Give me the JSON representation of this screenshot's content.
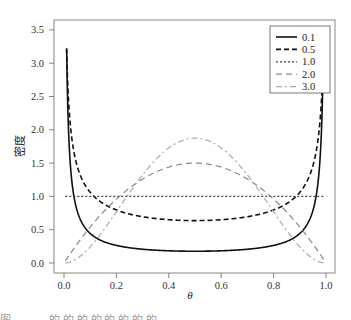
{
  "chart_data": {
    "type": "line",
    "title": "",
    "xlabel": "θ",
    "ylabel": "密度",
    "xlim": [
      0.0,
      1.0
    ],
    "ylim": [
      0.0,
      3.5
    ],
    "x_ticks": [
      "0.0",
      "0.2",
      "0.4",
      "0.6",
      "0.8",
      "1.0"
    ],
    "y_ticks": [
      "0.0",
      "0.5",
      "1.0",
      "1.5",
      "2.0",
      "2.5",
      "3.0",
      "3.5"
    ],
    "grid": false,
    "legend_position": "top-right",
    "x": [
      0.005,
      0.05,
      0.1,
      0.2,
      0.3,
      0.4,
      0.5,
      0.6,
      0.7,
      0.8,
      0.9,
      0.95,
      0.995
    ],
    "series": [
      {
        "name": "0.1",
        "style": "solid",
        "color": "#111111",
        "values": [
          3.22,
          0.52,
          0.32,
          0.22,
          0.19,
          0.17,
          0.17,
          0.17,
          0.19,
          0.22,
          0.32,
          0.52,
          3.22
        ]
      },
      {
        "name": "0.5",
        "style": "dashed",
        "color": "#111111",
        "values": [
          4.5,
          1.46,
          1.06,
          0.8,
          0.69,
          0.65,
          0.64,
          0.65,
          0.69,
          0.8,
          1.06,
          1.46,
          4.5
        ]
      },
      {
        "name": "1.0",
        "style": "dotted",
        "color": "#444444",
        "values": [
          1.0,
          1.0,
          1.0,
          1.0,
          1.0,
          1.0,
          1.0,
          1.0,
          1.0,
          1.0,
          1.0,
          1.0,
          1.0
        ]
      },
      {
        "name": "2.0",
        "style": "dashed-long",
        "color": "#888888",
        "values": [
          0.03,
          0.29,
          0.54,
          0.96,
          1.26,
          1.44,
          1.5,
          1.44,
          1.26,
          0.96,
          0.54,
          0.29,
          0.03
        ]
      },
      {
        "name": "3.0",
        "style": "dash-dot",
        "color": "#aaaaaa",
        "values": [
          0.0,
          0.07,
          0.24,
          0.77,
          1.32,
          1.73,
          1.88,
          1.73,
          1.32,
          0.77,
          0.24,
          0.07,
          0.0
        ]
      }
    ]
  },
  "legend": {
    "items": [
      {
        "label": "0.1"
      },
      {
        "label": "0.5"
      },
      {
        "label": "1.0"
      },
      {
        "label": "2.0"
      },
      {
        "label": "3.0"
      }
    ]
  },
  "caption": "图 ···· ·····的 的 的 的 的 的 的 的"
}
